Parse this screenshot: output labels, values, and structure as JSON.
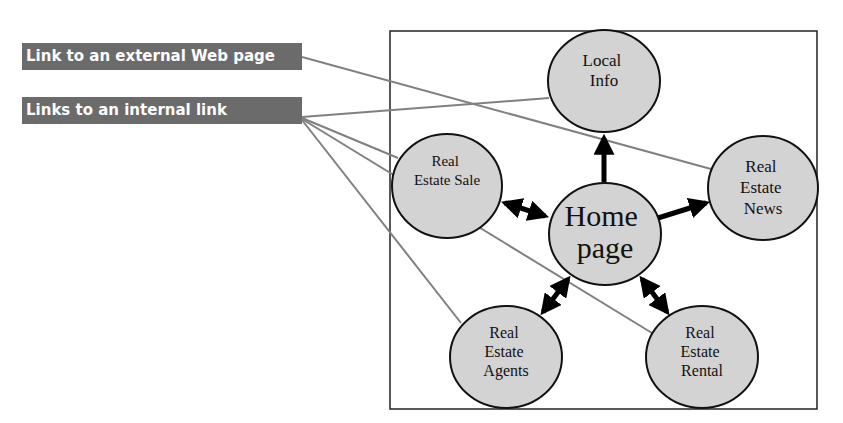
{
  "legend": {
    "external_label": "Link to an external Web page",
    "internal_label": "Links to an internal link",
    "label_bg_color": "#6b6b6b",
    "link_line_color": "#7f7f7f"
  },
  "nodes": {
    "local_info": {
      "lines": [
        "Local",
        "Info"
      ]
    },
    "home": {
      "lines": [
        "Home",
        "page"
      ]
    },
    "sale": {
      "lines": [
        "Real",
        "Estate Sale"
      ]
    },
    "news": {
      "lines": [
        "Real",
        "Estate",
        "News"
      ]
    },
    "agents": {
      "lines": [
        "Real",
        "Estate",
        "Agents"
      ]
    },
    "rental": {
      "lines": [
        "Real",
        "Estate",
        "Rental"
      ]
    }
  },
  "node_fill_color": "#d3d3d3",
  "edges": [
    {
      "from": "Home page",
      "to": "Local Info",
      "type": "one-way"
    },
    {
      "from": "Home page",
      "to": "Real Estate News",
      "type": "one-way"
    },
    {
      "from": "Home page",
      "to": "Real Estate Sale",
      "type": "two-way"
    },
    {
      "from": "Home page",
      "to": "Real Estate Agents",
      "type": "two-way"
    },
    {
      "from": "Home page",
      "to": "Real Estate Rental",
      "type": "two-way"
    }
  ],
  "annotation_links": {
    "external": [
      "Real Estate News"
    ],
    "internal": [
      "Local Info",
      "Real Estate Sale",
      "Real Estate Rental",
      "Real Estate Agents"
    ]
  }
}
